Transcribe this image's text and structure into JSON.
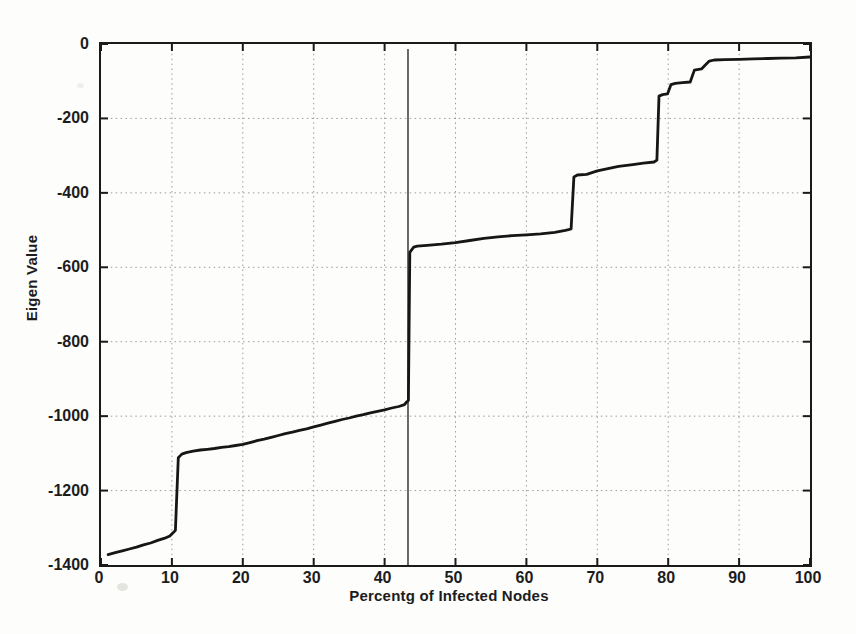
{
  "figure": {
    "background": "#fdfdfc",
    "axis_color": "#1a1a1a",
    "grid_color": "#9b9b9b",
    "tick_color": "#1a1a1a"
  },
  "chart_data": {
    "type": "line",
    "title": "",
    "xlabel": "Percentg of Infected Nodes",
    "ylabel": "Eigen Value",
    "xlim": [
      0,
      100
    ],
    "ylim": [
      -1400,
      0
    ],
    "xticks": [
      0,
      10,
      20,
      30,
      40,
      50,
      60,
      70,
      80,
      90,
      100
    ],
    "yticks": [
      0,
      -200,
      -400,
      -600,
      -800,
      -1000,
      -1200,
      -1400
    ],
    "grid": "dotted",
    "legend": null,
    "series": [
      {
        "name": "sorted eigenvalues",
        "color": "#161616",
        "width": 2.8,
        "points": [
          [
            1,
            -1372
          ],
          [
            2,
            -1367
          ],
          [
            3,
            -1362
          ],
          [
            4,
            -1357
          ],
          [
            5,
            -1352
          ],
          [
            6,
            -1346
          ],
          [
            7,
            -1341
          ],
          [
            8,
            -1334
          ],
          [
            9,
            -1328
          ],
          [
            9.7,
            -1322
          ],
          [
            10.2,
            -1313
          ],
          [
            10.5,
            -1307
          ],
          [
            10.9,
            -1112
          ],
          [
            11.4,
            -1102
          ],
          [
            12,
            -1098
          ],
          [
            13,
            -1094
          ],
          [
            14,
            -1091
          ],
          [
            15,
            -1089
          ],
          [
            16,
            -1087
          ],
          [
            17,
            -1084
          ],
          [
            18,
            -1082
          ],
          [
            19,
            -1079
          ],
          [
            20,
            -1076
          ],
          [
            21,
            -1071
          ],
          [
            22,
            -1066
          ],
          [
            23,
            -1062
          ],
          [
            24,
            -1057
          ],
          [
            25,
            -1052
          ],
          [
            26,
            -1047
          ],
          [
            27,
            -1043
          ],
          [
            28,
            -1038
          ],
          [
            29,
            -1034
          ],
          [
            30,
            -1029
          ],
          [
            31,
            -1024
          ],
          [
            32,
            -1019
          ],
          [
            33,
            -1014
          ],
          [
            34,
            -1009
          ],
          [
            35,
            -1005
          ],
          [
            36,
            -1000
          ],
          [
            37,
            -996
          ],
          [
            38,
            -991
          ],
          [
            39,
            -987
          ],
          [
            40,
            -983
          ],
          [
            41,
            -978
          ],
          [
            42,
            -974
          ],
          [
            42.8,
            -969
          ],
          [
            43.1,
            -962
          ],
          [
            43.35,
            -958
          ],
          [
            43.55,
            -560
          ],
          [
            44.1,
            -546
          ],
          [
            44.6,
            -543
          ],
          [
            46,
            -541
          ],
          [
            48,
            -538
          ],
          [
            50,
            -534
          ],
          [
            52,
            -528
          ],
          [
            54,
            -522
          ],
          [
            56,
            -518
          ],
          [
            58,
            -515
          ],
          [
            60,
            -513
          ],
          [
            62,
            -510
          ],
          [
            64,
            -506
          ],
          [
            65.5,
            -501
          ],
          [
            66.3,
            -497
          ],
          [
            66.7,
            -357
          ],
          [
            67.2,
            -352
          ],
          [
            68.5,
            -350
          ],
          [
            70,
            -341
          ],
          [
            71.5,
            -335
          ],
          [
            73,
            -329
          ],
          [
            75,
            -324
          ],
          [
            76.5,
            -320
          ],
          [
            78,
            -317
          ],
          [
            78.4,
            -312
          ],
          [
            78.7,
            -140
          ],
          [
            79.2,
            -136
          ],
          [
            79.9,
            -134
          ],
          [
            80.4,
            -109
          ],
          [
            81,
            -106
          ],
          [
            82,
            -104
          ],
          [
            83.1,
            -102
          ],
          [
            83.7,
            -70
          ],
          [
            84.7,
            -67
          ],
          [
            85.2,
            -57
          ],
          [
            85.8,
            -46
          ],
          [
            86.5,
            -43
          ],
          [
            88,
            -42
          ],
          [
            90,
            -41
          ],
          [
            92,
            -40
          ],
          [
            94,
            -39
          ],
          [
            96,
            -38
          ],
          [
            98,
            -37
          ],
          [
            100,
            -35
          ]
        ]
      }
    ],
    "annotations": [
      {
        "type": "vline",
        "x": 43.3,
        "color": "#1b1b1b",
        "width": 1.3
      }
    ]
  }
}
